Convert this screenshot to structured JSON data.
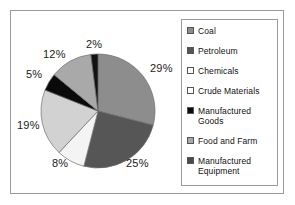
{
  "chart_data": {
    "type": "pie",
    "title": "",
    "legend_position": "right",
    "categories": [
      "Coal",
      "Petroleum",
      "Chemicals",
      "Crude Materials",
      "Manufactured Goods",
      "Food and Farm",
      "Manufactured Equipment"
    ],
    "values": [
      29,
      25,
      8,
      19,
      5,
      12,
      2
    ],
    "value_labels": [
      "29%",
      "25%",
      "8%",
      "19%",
      "5%",
      "12%",
      "2%"
    ],
    "colors": [
      "#8d8d8d",
      "#565656",
      "#f4f4f4",
      "#d2d2d2",
      "#0a0a0a",
      "#a9a9a9",
      "#121212"
    ],
    "start_angle_deg": 0,
    "direction": "clockwise"
  },
  "legend": {
    "items": [
      {
        "label": "Coal",
        "color": "#8d8d8d"
      },
      {
        "label": "Petroleum",
        "color": "#565656"
      },
      {
        "label": "Chemicals",
        "color": "#fbfbfb"
      },
      {
        "label": "Crude Materials",
        "color": "#fbfbfb"
      },
      {
        "label": "Manufactured Goods",
        "color": "#0a0a0a"
      },
      {
        "label": "Food and Farm",
        "color": "#a9a9a9"
      },
      {
        "label": "Manufactured Equipment",
        "color": "#4a4a4a"
      }
    ]
  },
  "pie_labels": [
    {
      "text": "29%",
      "left": 139,
      "top": 51
    },
    {
      "text": "25%",
      "left": 115,
      "top": 146
    },
    {
      "text": "8%",
      "left": 41,
      "top": 146
    },
    {
      "text": "19%",
      "left": 6,
      "top": 108
    },
    {
      "text": "5%",
      "left": 15,
      "top": 57
    },
    {
      "text": "12%",
      "left": 32,
      "top": 37
    },
    {
      "text": "2%",
      "left": 75,
      "top": 27
    }
  ]
}
